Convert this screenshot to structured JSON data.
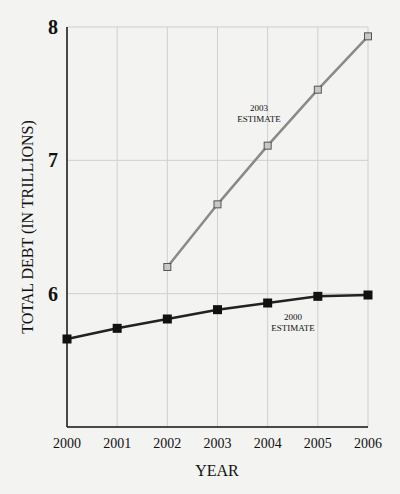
{
  "chart_data": {
    "type": "line",
    "title": "",
    "xlabel": "YEAR",
    "ylabel": "TOTAL DEBT (IN TRILLIONS)",
    "x": [
      2000,
      2001,
      2002,
      2003,
      2004,
      2005,
      2006
    ],
    "xticks": [
      "2000",
      "2001",
      "2002",
      "2003",
      "2004",
      "2005",
      "2006"
    ],
    "yticks": [
      "6",
      "7",
      "8"
    ],
    "ylim": [
      5,
      8
    ],
    "grid": true,
    "legend": "inline annotations",
    "series": [
      {
        "name": "2000 ESTIMATE",
        "label_line1": "2000",
        "label_line2": "ESTIMATE",
        "color": "#222222",
        "marker": "filled-square",
        "x": [
          2000,
          2001,
          2002,
          2003,
          2004,
          2005,
          2006
        ],
        "values": [
          5.66,
          5.74,
          5.81,
          5.88,
          5.93,
          5.98,
          5.99
        ]
      },
      {
        "name": "2003 ESTIMATE",
        "label_line1": "2003",
        "label_line2": "ESTIMATE",
        "color": "#8a8a8a",
        "marker": "hollow-square",
        "x": [
          2002,
          2003,
          2004,
          2005,
          2006
        ],
        "values": [
          6.2,
          6.67,
          7.11,
          7.53,
          7.93
        ]
      }
    ]
  }
}
